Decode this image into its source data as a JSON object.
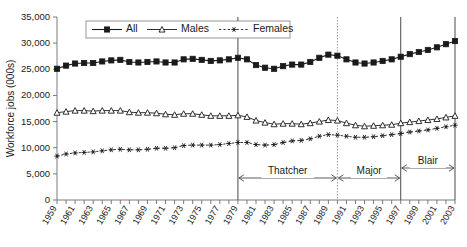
{
  "chart_data": {
    "type": "line",
    "title": "",
    "xlabel": "",
    "ylabel": "Workforce jobs (000s)",
    "ylim": [
      0,
      35000
    ],
    "ytick_labels": [
      "0",
      "5,000",
      "10,000",
      "15,000",
      "20,000",
      "25,000",
      "30,000",
      "35,000"
    ],
    "ytick_values": [
      0,
      5000,
      10000,
      15000,
      20000,
      25000,
      30000,
      35000
    ],
    "grid": false,
    "legend_position": "top-center",
    "x": [
      1959,
      1960,
      1961,
      1962,
      1963,
      1964,
      1965,
      1966,
      1967,
      1968,
      1969,
      1970,
      1971,
      1972,
      1973,
      1974,
      1975,
      1976,
      1977,
      1978,
      1979,
      1980,
      1981,
      1982,
      1983,
      1984,
      1985,
      1986,
      1987,
      1988,
      1989,
      1990,
      1991,
      1992,
      1993,
      1994,
      1995,
      1996,
      1997,
      1998,
      1999,
      2000,
      2001,
      2002,
      2003
    ],
    "xtick_labels": [
      "1959",
      "1961",
      "1963",
      "1965",
      "1967",
      "1969",
      "1971",
      "1973",
      "1975",
      "1977",
      "1979",
      "1981",
      "1983",
      "1985",
      "1987",
      "1989",
      "1991",
      "1993",
      "1995",
      "1997",
      "1999",
      "2001",
      "2003"
    ],
    "series": [
      {
        "name": "All",
        "marker": "filled-square",
        "values": [
          25100,
          25700,
          26100,
          26200,
          26200,
          26500,
          26700,
          26800,
          26400,
          26300,
          26400,
          26500,
          26300,
          26300,
          26900,
          27000,
          26800,
          26600,
          26700,
          26900,
          27200,
          26900,
          25800,
          25300,
          25100,
          25600,
          25900,
          25900,
          26400,
          27200,
          27800,
          27600,
          26900,
          26300,
          26100,
          26300,
          26600,
          26900,
          27400,
          27900,
          28300,
          28700,
          29200,
          29800,
          30400
        ]
      },
      {
        "name": "Males",
        "marker": "open-triangle",
        "values": [
          16700,
          16900,
          17100,
          17100,
          17000,
          17100,
          17100,
          17100,
          16800,
          16700,
          16700,
          16600,
          16400,
          16300,
          16500,
          16500,
          16300,
          16100,
          16100,
          16100,
          16200,
          15900,
          15200,
          14800,
          14500,
          14600,
          14600,
          14500,
          14700,
          15000,
          15300,
          15200,
          14700,
          14300,
          14100,
          14200,
          14300,
          14400,
          14700,
          14900,
          15100,
          15300,
          15500,
          15800,
          16100
        ]
      },
      {
        "name": "Females",
        "marker": "asterisk",
        "values": [
          8400,
          8800,
          9000,
          9100,
          9200,
          9400,
          9600,
          9700,
          9600,
          9600,
          9700,
          9900,
          9900,
          10000,
          10400,
          10500,
          10500,
          10500,
          10600,
          10800,
          11000,
          11000,
          10600,
          10500,
          10600,
          11000,
          11300,
          11400,
          11700,
          12200,
          12500,
          12400,
          12200,
          12000,
          12000,
          12100,
          12300,
          12500,
          12700,
          13000,
          13200,
          13400,
          13700,
          14000,
          14300
        ]
      }
    ],
    "annotations": [
      {
        "label": "Thatcher",
        "start": 1979,
        "end": 1990,
        "start_line": "solid",
        "end_line": "dotted"
      },
      {
        "label": "Major",
        "start": 1990,
        "end": 1997,
        "start_line": "dotted",
        "end_line": "solid"
      },
      {
        "label": "Blair",
        "start": 1997,
        "end": 2003,
        "start_line": "solid",
        "end_line": "solid"
      }
    ]
  }
}
